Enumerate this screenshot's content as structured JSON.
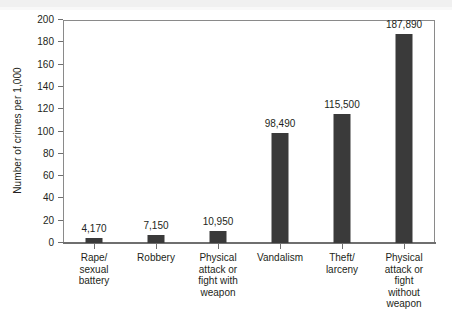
{
  "chart_data": {
    "type": "bar",
    "title": "",
    "xlabel": "",
    "ylabel": "Number of crimes per 1,000",
    "ylim": [
      0,
      200
    ],
    "ytick_step": 20,
    "grid": false,
    "legend": null,
    "bar_color": "#3a3a3a",
    "categories": [
      "Rape/ sexual battery",
      "Robbery",
      "Physical attack or fight with weapon",
      "Vandalism",
      "Theft/ larceny",
      "Physical attack or fight without weapon"
    ],
    "category_lines": [
      [
        "Rape/",
        "sexual",
        "battery"
      ],
      [
        "Robbery"
      ],
      [
        "Physical",
        "attack or",
        "fight with",
        "weapon"
      ],
      [
        "Vandalism"
      ],
      [
        "Theft/",
        "larceny"
      ],
      [
        "Physical",
        "attack or",
        "fight",
        "without",
        "weapon"
      ]
    ],
    "values": [
      4.17,
      7.15,
      10.95,
      98.49,
      115.5,
      187.89
    ],
    "value_labels": [
      "4,170",
      "7,150",
      "10,950",
      "98,490",
      "115,500",
      "187,890"
    ],
    "yticks": [
      "0",
      "20",
      "40",
      "60",
      "80",
      "100",
      "120",
      "140",
      "160",
      "180",
      "200"
    ],
    "ytick_values": [
      0,
      20,
      40,
      60,
      80,
      100,
      120,
      140,
      160,
      180,
      200
    ]
  }
}
